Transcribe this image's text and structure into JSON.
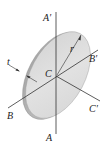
{
  "diagram": {
    "labels": {
      "a_prime": "A′",
      "a": "A",
      "b": "B",
      "b_prime": "B′",
      "c": "C",
      "c_prime": "C′",
      "radius": "r",
      "thickness": "t"
    },
    "colors": {
      "disk_face": "#dcdcdc",
      "disk_rim": "#b8b8b8",
      "axis_line": "#333333",
      "text": "#222222"
    }
  }
}
